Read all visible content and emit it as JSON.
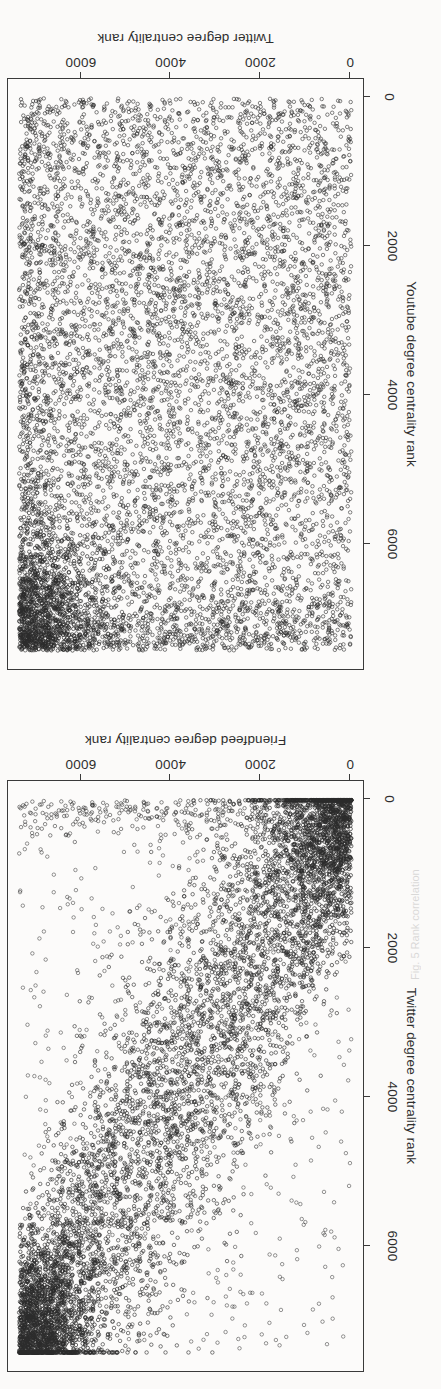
{
  "figure": {
    "orientation": "rotated-180",
    "background_color": "#fbfaf9",
    "ink_color": "#2e2e2e",
    "point_color": "#2b2b2b",
    "caption_fragment": "Fig. 5  Rank correlation"
  },
  "chart_data": [
    {
      "type": "scatter",
      "panel": "top",
      "title": "",
      "xlabel": "Twitter degree centrality rank",
      "ylabel": "Youtube degree centrality rank",
      "xticks": [
        0,
        2000,
        4000,
        6000
      ],
      "yticks": [
        0,
        2000,
        4000,
        6000
      ],
      "xticklabels": [
        "0",
        "2000",
        "4000",
        "6000"
      ],
      "yticklabels": [
        "0",
        "2000",
        "4000",
        "6000"
      ],
      "xlim": [
        -260,
        7700
      ],
      "ylim": [
        -260,
        7700
      ],
      "grid": false,
      "legend": false,
      "marker": "open-circle",
      "n_points": 7400,
      "correlation": 0.02,
      "pattern": "uniform-uncorrelated-cloud-with-dense-high-high-corner",
      "density_note": "Points fill the square nearly uniformly; a markedly darker saturated cluster sits at the high-rank / high-rank corner."
    },
    {
      "type": "scatter",
      "panel": "bottom",
      "title": "",
      "xlabel": "Friendfeed degree centrality rank",
      "ylabel": "Twitter degree centrality rank",
      "xticks": [
        0,
        2000,
        4000,
        6000
      ],
      "yticks": [
        0,
        2000,
        4000,
        6000
      ],
      "xticklabels": [
        "0",
        "2000",
        "4000",
        "6000"
      ],
      "yticklabels": [
        "0",
        "2000",
        "4000",
        "6000"
      ],
      "xlim": [
        -260,
        7700
      ],
      "ylim": [
        -260,
        7700
      ],
      "grid": false,
      "legend": false,
      "marker": "open-circle",
      "n_points": 7400,
      "correlation": 0.72,
      "pattern": "strong-positive-diagonal-band",
      "density_note": "Dense diagonal band from low-low to high-high with heavy saturation at both ends and sparse outliers above and below the band."
    }
  ]
}
